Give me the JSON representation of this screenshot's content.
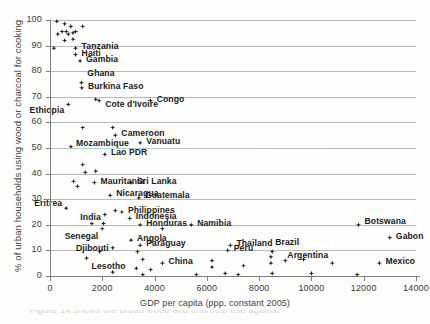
{
  "figure": {
    "background": "#fdfdfc",
    "point_color": "#151515",
    "grid_color": "#b9b9b9",
    "axis_color": "#7d7d7d",
    "caption_partial": "Figure 14 shows the urban wood and charcoal use against"
  },
  "chart_data": {
    "type": "scatter",
    "title": "",
    "xlabel": "GDP per capita (ppp, constant 2005)",
    "ylabel": "% of urban households using wood or charcoal for cooking",
    "xlim": [
      0,
      14000
    ],
    "ylim": [
      0,
      100
    ],
    "xticks": [
      0,
      2000,
      4000,
      6000,
      8000,
      10000,
      12000,
      14000
    ],
    "xtick_labels": [
      "0",
      "2000",
      "4000",
      "6000",
      "8000",
      "10000",
      "12000",
      "14000"
    ],
    "yticks": [
      0,
      10,
      20,
      30,
      40,
      50,
      60,
      70,
      80,
      90,
      100
    ],
    "ytick_labels": [
      "0",
      "10",
      "20",
      "30",
      "40",
      "50",
      "60",
      "70",
      "80",
      "90",
      "100"
    ],
    "grid": "horizontal",
    "legend": "none",
    "points": [
      {
        "x": 260,
        "y": 99.5,
        "label": "",
        "lx": 0,
        "ly": 0,
        "anchor": "start"
      },
      {
        "x": 560,
        "y": 98.5,
        "label": "",
        "lx": 0,
        "ly": 0,
        "anchor": "start"
      },
      {
        "x": 800,
        "y": 97.5,
        "label": "",
        "lx": 0,
        "ly": 0,
        "anchor": "start"
      },
      {
        "x": 1250,
        "y": 97.5,
        "label": "",
        "lx": 0,
        "ly": 0,
        "anchor": "start"
      },
      {
        "x": 300,
        "y": 94.5,
        "label": "",
        "lx": 0,
        "ly": 0,
        "anchor": "start"
      },
      {
        "x": 460,
        "y": 95.5,
        "label": "",
        "lx": 0,
        "ly": 0,
        "anchor": "start"
      },
      {
        "x": 620,
        "y": 95.5,
        "label": "",
        "lx": 0,
        "ly": 0,
        "anchor": "start"
      },
      {
        "x": 700,
        "y": 94.5,
        "label": "",
        "lx": 0,
        "ly": 0,
        "anchor": "start"
      },
      {
        "x": 880,
        "y": 95.0,
        "label": "",
        "lx": 0,
        "ly": 0,
        "anchor": "start"
      },
      {
        "x": 980,
        "y": 95.5,
        "label": "",
        "lx": 0,
        "ly": 0,
        "anchor": "start"
      },
      {
        "x": 560,
        "y": 92.0,
        "label": "",
        "lx": 0,
        "ly": 0,
        "anchor": "start"
      },
      {
        "x": 880,
        "y": 92.5,
        "label": "",
        "lx": 0,
        "ly": 0,
        "anchor": "start"
      },
      {
        "x": 150,
        "y": 89.0,
        "label": "",
        "lx": 0,
        "ly": 0,
        "anchor": "start"
      },
      {
        "x": 980,
        "y": 89.0,
        "label": "Tanzania",
        "lx": 6,
        "ly": -3,
        "anchor": "start"
      },
      {
        "x": 980,
        "y": 86.5,
        "label": "Haiti",
        "lx": 6,
        "ly": -3,
        "anchor": "start"
      },
      {
        "x": 1150,
        "y": 84.0,
        "label": "Gambia",
        "lx": 6,
        "ly": -3,
        "anchor": "start"
      },
      {
        "x": 1200,
        "y": 75.5,
        "label": "Ghana",
        "lx": 6,
        "ly": -11,
        "anchor": "start"
      },
      {
        "x": 1220,
        "y": 73.5,
        "label": "Burkina Faso",
        "lx": 6,
        "ly": -3,
        "anchor": "start"
      },
      {
        "x": 1750,
        "y": 69.0,
        "label": "",
        "lx": 0,
        "ly": 0,
        "anchor": "start"
      },
      {
        "x": 1880,
        "y": 68.5,
        "label": "Cote d'Ivoire",
        "lx": 6,
        "ly": 2,
        "anchor": "start"
      },
      {
        "x": 3850,
        "y": 68.5,
        "label": "Congo",
        "lx": 6,
        "ly": -3,
        "anchor": "start"
      },
      {
        "x": 700,
        "y": 67.0,
        "label": "Ethiopia",
        "lx": -4,
        "ly": 5,
        "anchor": "end"
      },
      {
        "x": 1250,
        "y": 58.0,
        "label": "",
        "lx": 0,
        "ly": 0,
        "anchor": "start"
      },
      {
        "x": 2400,
        "y": 58.0,
        "label": "",
        "lx": 0,
        "ly": 0,
        "anchor": "start"
      },
      {
        "x": 2500,
        "y": 55.0,
        "label": "Cameroon",
        "lx": 6,
        "ly": -3,
        "anchor": "start"
      },
      {
        "x": 3450,
        "y": 52.0,
        "label": "Vanuatu",
        "lx": 6,
        "ly": -3,
        "anchor": "start"
      },
      {
        "x": 800,
        "y": 50.5,
        "label": "Mozambique",
        "lx": 5,
        "ly": -5,
        "anchor": "start"
      },
      {
        "x": 2100,
        "y": 47.5,
        "label": "Lao PDR",
        "lx": 6,
        "ly": -3,
        "anchor": "start"
      },
      {
        "x": 1250,
        "y": 43.5,
        "label": "",
        "lx": 0,
        "ly": 0,
        "anchor": "start"
      },
      {
        "x": 1350,
        "y": 40.5,
        "label": "",
        "lx": 0,
        "ly": 0,
        "anchor": "start"
      },
      {
        "x": 1750,
        "y": 41.0,
        "label": "",
        "lx": 0,
        "ly": 0,
        "anchor": "start"
      },
      {
        "x": 900,
        "y": 37.0,
        "label": "",
        "lx": 0,
        "ly": 0,
        "anchor": "start"
      },
      {
        "x": 1050,
        "y": 35.0,
        "label": "",
        "lx": 0,
        "ly": 0,
        "anchor": "start"
      },
      {
        "x": 1700,
        "y": 36.5,
        "label": "Mauritania",
        "lx": 6,
        "ly": -3,
        "anchor": "start"
      },
      {
        "x": 3100,
        "y": 36.5,
        "label": "Sri Lanka",
        "lx": 6,
        "ly": -3,
        "anchor": "start"
      },
      {
        "x": 2300,
        "y": 31.5,
        "label": "Nicaragua",
        "lx": 6,
        "ly": -3,
        "anchor": "start"
      },
      {
        "x": 3400,
        "y": 30.5,
        "label": "Guatemala",
        "lx": 6,
        "ly": -4,
        "anchor": "start"
      },
      {
        "x": 620,
        "y": 26.5,
        "label": "Eritrea",
        "lx": -4,
        "ly": -6,
        "anchor": "end"
      },
      {
        "x": 2500,
        "y": 25.5,
        "label": "",
        "lx": 0,
        "ly": 0,
        "anchor": "start"
      },
      {
        "x": 2750,
        "y": 25.0,
        "label": "Philippines",
        "lx": 6,
        "ly": -3,
        "anchor": "start"
      },
      {
        "x": 2100,
        "y": 24.0,
        "label": "India",
        "lx": -4,
        "ly": 1,
        "anchor": "end"
      },
      {
        "x": 3050,
        "y": 22.5,
        "label": "Indonesia",
        "lx": 6,
        "ly": -3,
        "anchor": "start"
      },
      {
        "x": 1600,
        "y": 20.5,
        "label": "",
        "lx": 0,
        "ly": 0,
        "anchor": "start"
      },
      {
        "x": 2050,
        "y": 20.5,
        "label": "",
        "lx": 0,
        "ly": 0,
        "anchor": "start"
      },
      {
        "x": 2000,
        "y": 18.5,
        "label": "Senegal",
        "lx": -4,
        "ly": 6,
        "anchor": "end"
      },
      {
        "x": 3450,
        "y": 20.0,
        "label": "Honduras",
        "lx": 6,
        "ly": -3,
        "anchor": "start"
      },
      {
        "x": 4300,
        "y": 18.5,
        "label": "",
        "lx": 0,
        "ly": 0,
        "anchor": "start"
      },
      {
        "x": 5400,
        "y": 20.0,
        "label": "Namibia",
        "lx": 6,
        "ly": -3,
        "anchor": "start"
      },
      {
        "x": 11800,
        "y": 20.0,
        "label": "Botswana",
        "lx": 6,
        "ly": -5,
        "anchor": "start"
      },
      {
        "x": 3100,
        "y": 14.0,
        "label": "Angola",
        "lx": 6,
        "ly": -3,
        "anchor": "start"
      },
      {
        "x": 3450,
        "y": 12.0,
        "label": "Paraguay",
        "lx": 6,
        "ly": -3,
        "anchor": "start"
      },
      {
        "x": 6900,
        "y": 12.0,
        "label": "Thailand",
        "lx": 6,
        "ly": -3,
        "anchor": "start"
      },
      {
        "x": 13000,
        "y": 15.0,
        "label": "Gabon",
        "lx": 6,
        "ly": -3,
        "anchor": "start"
      },
      {
        "x": 2400,
        "y": 11.0,
        "label": "Djibouti",
        "lx": -4,
        "ly": -1,
        "anchor": "end"
      },
      {
        "x": 1900,
        "y": 9.5,
        "label": "",
        "lx": 0,
        "ly": 0,
        "anchor": "start"
      },
      {
        "x": 3350,
        "y": 9.5,
        "label": "",
        "lx": 0,
        "ly": 0,
        "anchor": "start"
      },
      {
        "x": 6800,
        "y": 10.0,
        "label": "Peru",
        "lx": 6,
        "ly": -3,
        "anchor": "start"
      },
      {
        "x": 8500,
        "y": 9.5,
        "label": "Brazil",
        "lx": 3,
        "ly": -11,
        "anchor": "start"
      },
      {
        "x": 1400,
        "y": 7.0,
        "label": "Lesotho",
        "lx": 5,
        "ly": 7,
        "anchor": "start"
      },
      {
        "x": 3550,
        "y": 6.5,
        "label": "",
        "lx": 0,
        "ly": 0,
        "anchor": "start"
      },
      {
        "x": 4300,
        "y": 5.0,
        "label": "China",
        "lx": 6,
        "ly": -3,
        "anchor": "start"
      },
      {
        "x": 8450,
        "y": 5.0,
        "label": "",
        "lx": 0,
        "ly": 0,
        "anchor": "start"
      },
      {
        "x": 8450,
        "y": 7.5,
        "label": "",
        "lx": 0,
        "ly": 0,
        "anchor": "start"
      },
      {
        "x": 9000,
        "y": 6.0,
        "label": "",
        "lx": 0,
        "ly": 0,
        "anchor": "start"
      },
      {
        "x": 9700,
        "y": 6.5,
        "label": "",
        "lx": 0,
        "ly": 0,
        "anchor": "start"
      },
      {
        "x": 10800,
        "y": 5.0,
        "label": "Argentina",
        "lx": -4,
        "ly": -9,
        "anchor": "end"
      },
      {
        "x": 12600,
        "y": 5.0,
        "label": "Mexico",
        "lx": 6,
        "ly": -3,
        "anchor": "start"
      },
      {
        "x": 6200,
        "y": 6.0,
        "label": "",
        "lx": 0,
        "ly": 0,
        "anchor": "start"
      },
      {
        "x": 6200,
        "y": 3.5,
        "label": "",
        "lx": 0,
        "ly": 0,
        "anchor": "start"
      },
      {
        "x": 7400,
        "y": 4.0,
        "label": "",
        "lx": 0,
        "ly": 0,
        "anchor": "start"
      },
      {
        "x": 3300,
        "y": 3.0,
        "label": "",
        "lx": 0,
        "ly": 0,
        "anchor": "start"
      },
      {
        "x": 3850,
        "y": 2.5,
        "label": "",
        "lx": 0,
        "ly": 0,
        "anchor": "start"
      },
      {
        "x": 2400,
        "y": 1.5,
        "label": "",
        "lx": 0,
        "ly": 0,
        "anchor": "start"
      },
      {
        "x": 3550,
        "y": 0.5,
        "label": "",
        "lx": 0,
        "ly": 0,
        "anchor": "start"
      },
      {
        "x": 5600,
        "y": 0.5,
        "label": "",
        "lx": 0,
        "ly": 0,
        "anchor": "start"
      },
      {
        "x": 6700,
        "y": 1.0,
        "label": "",
        "lx": 0,
        "ly": 0,
        "anchor": "start"
      },
      {
        "x": 7200,
        "y": 0.5,
        "label": "",
        "lx": 0,
        "ly": 0,
        "anchor": "start"
      },
      {
        "x": 8500,
        "y": 1.0,
        "label": "",
        "lx": 0,
        "ly": 0,
        "anchor": "start"
      },
      {
        "x": 10000,
        "y": 1.0,
        "label": "",
        "lx": 0,
        "ly": 0,
        "anchor": "start"
      },
      {
        "x": 11750,
        "y": 0.5,
        "label": "",
        "lx": 0,
        "ly": 0,
        "anchor": "start"
      }
    ]
  }
}
